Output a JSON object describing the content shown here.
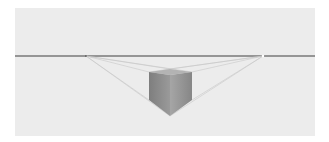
{
  "figure": {
    "colors": {
      "background": "#ffffff",
      "panel": "#ececec",
      "horizon": "#3f3f3f",
      "guides": "#c4c4c4",
      "cube_left_face": "#8a8a8a",
      "cube_right_face": "#9a9a9a",
      "cube_top_face": "#b8b8b8"
    },
    "horizon_y": 56,
    "vanishing_points": {
      "left": [
        86,
        56
      ],
      "right": [
        263,
        56
      ]
    },
    "cube": {
      "top_front": [
        170,
        69
      ],
      "top_left": [
        149,
        72
      ],
      "top_right": [
        192,
        72
      ],
      "bottom_left": [
        149,
        100
      ],
      "bottom_right": [
        192,
        100
      ],
      "bottom_front": [
        170,
        116
      ]
    }
  }
}
